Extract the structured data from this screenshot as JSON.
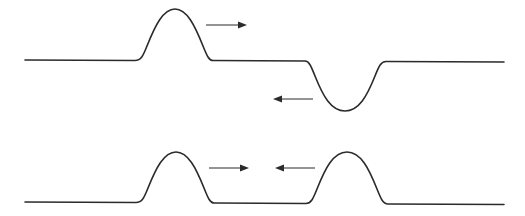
{
  "diagram": {
    "colors": {
      "line": "#2b2b2b",
      "background": "#ffffff"
    },
    "panels": [
      {
        "id": "top",
        "pulses": [
          {
            "type": "upright",
            "direction": "right"
          },
          {
            "type": "inverted",
            "direction": "left"
          }
        ]
      },
      {
        "id": "bottom",
        "pulses": [
          {
            "type": "upright",
            "direction": "right"
          },
          {
            "type": "upright",
            "direction": "left"
          }
        ]
      }
    ]
  }
}
